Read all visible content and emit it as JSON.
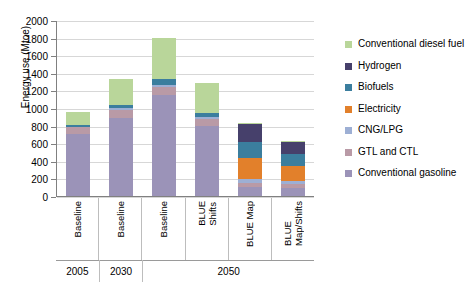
{
  "chart_data": {
    "type": "bar",
    "stacked": true,
    "title": "",
    "xlabel": "",
    "ylabel": "Energy use (Mtoe)",
    "ylim": [
      0,
      2000
    ],
    "yticks": [
      0,
      200,
      400,
      600,
      800,
      1000,
      1200,
      1400,
      1600,
      1800,
      2000
    ],
    "grid": true,
    "legend_position": "right",
    "categories": [
      "Baseline",
      "Baseline",
      "Baseline",
      "BLUE\nShifts",
      "BLUE Map",
      "BLUE\nMap/Shifts"
    ],
    "group_labels": [
      {
        "label": "2005",
        "span": 1
      },
      {
        "label": "2030",
        "span": 1
      },
      {
        "label": "2050",
        "span": 4
      }
    ],
    "series": [
      {
        "name": "Conventional gasoline",
        "color": "#9b93b8",
        "values": [
          700,
          890,
          1150,
          800,
          105,
          95
        ]
      },
      {
        "name": "GTL and CTL",
        "color": "#b99aa6",
        "values": [
          80,
          85,
          85,
          75,
          45,
          40
        ]
      },
      {
        "name": "CNG/LPG",
        "color": "#9dafd4",
        "values": [
          10,
          20,
          30,
          25,
          45,
          40
        ]
      },
      {
        "name": "Electricity",
        "color": "#e2802b",
        "values": [
          0,
          0,
          0,
          0,
          240,
          170
        ]
      },
      {
        "name": "Biofuels",
        "color": "#3b7e9e",
        "values": [
          20,
          40,
          60,
          45,
          175,
          135
        ]
      },
      {
        "name": "Hydrogen",
        "color": "#46406b",
        "values": [
          0,
          0,
          0,
          0,
          205,
          130
        ]
      },
      {
        "name": "Conventional diesel fuel",
        "color": "#b9d69a",
        "values": [
          140,
          290,
          470,
          340,
          15,
          10
        ]
      }
    ],
    "stack_order": [
      "Conventional gasoline",
      "GTL and CTL",
      "CNG/LPG",
      "Electricity",
      "Biofuels",
      "Hydrogen",
      "Conventional diesel fuel"
    ],
    "totals": [
      950,
      1325,
      1795,
      1285,
      830,
      620
    ]
  },
  "legend": {
    "items": [
      {
        "label": "Conventional diesel fuel",
        "color": "#b9d69a"
      },
      {
        "label": "Hydrogen",
        "color": "#46406b"
      },
      {
        "label": "Biofuels",
        "color": "#3b7e9e"
      },
      {
        "label": "Electricity",
        "color": "#e2802b"
      },
      {
        "label": "CNG/LPG",
        "color": "#9dafd4"
      },
      {
        "label": "GTL and CTL",
        "color": "#b99aa6"
      },
      {
        "label": "Conventional gasoline",
        "color": "#9b93b8"
      }
    ]
  }
}
